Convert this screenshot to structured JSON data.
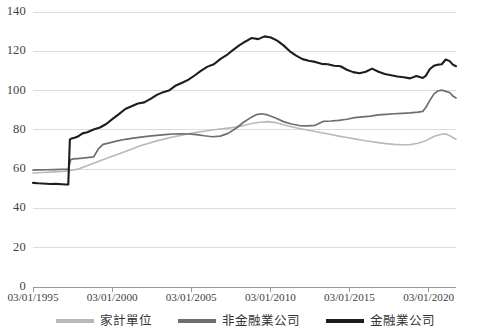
{
  "chart_data": {
    "type": "line",
    "title": "",
    "subtitle": "",
    "xlabel": "",
    "ylabel": "",
    "ylim": [
      0,
      140
    ],
    "yticks": [
      0,
      20,
      40,
      60,
      80,
      100,
      120,
      140
    ],
    "xticks": [
      "03/01/1995",
      "03/01/2000",
      "03/01/2005",
      "03/01/2010",
      "03/01/2015",
      "03/01/2020"
    ],
    "xtick_years": [
      1995,
      2000,
      2005,
      2010,
      2015,
      2020
    ],
    "xlim_years": [
      1995.17,
      2021.9
    ],
    "grid": "horizontal",
    "legend_position": "bottom",
    "series": [
      {
        "name": "家計單位",
        "color": "#b9b9b9",
        "linewidth": 1.6,
        "x": [
          1995.17,
          1995.5,
          1996.0,
          1996.5,
          1997.0,
          1997.25,
          1997.5,
          1997.75,
          1998.0,
          1998.5,
          1999.0,
          1999.5,
          2000.0,
          2000.5,
          2001.0,
          2001.5,
          2002.0,
          2002.5,
          2003.0,
          2003.5,
          2004.0,
          2004.5,
          2005.0,
          2005.5,
          2006.0,
          2006.5,
          2007.0,
          2007.5,
          2008.0,
          2008.5,
          2009.0,
          2009.5,
          2010.0,
          2010.5,
          2011.0,
          2011.5,
          2012.0,
          2012.5,
          2013.0,
          2013.5,
          2014.0,
          2014.5,
          2015.0,
          2015.5,
          2016.0,
          2016.5,
          2017.0,
          2017.5,
          2018.0,
          2018.5,
          2019.0,
          2019.5,
          2020.0,
          2020.25,
          2020.5,
          2020.75,
          2021.0,
          2021.25,
          2021.5,
          2021.9
        ],
        "values": [
          58.0,
          58.2,
          58.4,
          58.6,
          58.8,
          59.0,
          59.3,
          59.6,
          60.0,
          61.5,
          63.0,
          64.5,
          66.0,
          67.5,
          69.0,
          70.5,
          72.0,
          73.2,
          74.4,
          75.4,
          76.4,
          77.2,
          78.0,
          78.7,
          79.3,
          79.9,
          80.4,
          80.9,
          81.4,
          82.2,
          83.2,
          83.9,
          84.2,
          83.7,
          82.6,
          81.6,
          80.7,
          79.9,
          79.2,
          78.4,
          77.6,
          76.8,
          76.1,
          75.4,
          74.7,
          74.1,
          73.5,
          73.0,
          72.6,
          72.4,
          72.5,
          73.2,
          74.5,
          75.6,
          76.6,
          77.3,
          77.8,
          78.0,
          77.0,
          75.2
        ]
      },
      {
        "name": "非金融業公司",
        "color": "#6e6e6e",
        "linewidth": 1.7,
        "x": [
          1995.17,
          1995.5,
          1996.0,
          1996.5,
          1997.0,
          1997.4,
          1997.55,
          1997.7,
          1998.0,
          1998.3,
          1998.6,
          1999.0,
          1999.3,
          1999.6,
          2000.0,
          2000.5,
          2001.0,
          2001.5,
          2002.0,
          2002.5,
          2003.0,
          2003.5,
          2004.0,
          2004.5,
          2005.0,
          2005.5,
          2006.0,
          2006.5,
          2007.0,
          2007.5,
          2008.0,
          2008.5,
          2009.0,
          2009.3,
          2009.6,
          2010.0,
          2010.5,
          2011.0,
          2011.5,
          2012.0,
          2012.5,
          2013.0,
          2013.5,
          2014.0,
          2014.5,
          2015.0,
          2015.5,
          2016.0,
          2016.5,
          2017.0,
          2017.5,
          2018.0,
          2018.5,
          2019.0,
          2019.5,
          2019.8,
          2020.0,
          2020.25,
          2020.5,
          2020.75,
          2021.0,
          2021.25,
          2021.5,
          2021.7,
          2021.9
        ],
        "values": [
          59.5,
          59.6,
          59.7,
          59.8,
          59.9,
          60.0,
          64.8,
          65.2,
          65.4,
          65.6,
          65.9,
          66.2,
          70.3,
          72.6,
          73.4,
          74.4,
          75.2,
          75.8,
          76.3,
          76.8,
          77.2,
          77.6,
          77.9,
          78.0,
          77.9,
          77.6,
          77.0,
          76.5,
          76.8,
          78.2,
          80.8,
          84.0,
          86.6,
          87.8,
          88.2,
          87.6,
          86.0,
          84.2,
          83.0,
          82.2,
          82.0,
          82.3,
          84.3,
          84.5,
          84.8,
          85.4,
          86.2,
          86.6,
          87.0,
          87.6,
          87.9,
          88.2,
          88.4,
          88.6,
          89.0,
          89.4,
          91.5,
          95.0,
          98.2,
          99.8,
          100.2,
          99.6,
          99.0,
          97.2,
          96.2
        ]
      },
      {
        "name": "金融業公司",
        "color": "#1d1d1d",
        "linewidth": 2.1,
        "x": [
          1995.17,
          1995.5,
          1996.0,
          1996.3,
          1996.6,
          1997.0,
          1997.25,
          1997.4,
          1997.5,
          1997.6,
          1997.8,
          1998.0,
          1998.3,
          1998.6,
          1999.0,
          1999.4,
          1999.8,
          2000.2,
          2000.6,
          2001.0,
          2001.4,
          2001.8,
          2002.2,
          2002.6,
          2003.0,
          2003.4,
          2003.8,
          2004.2,
          2004.6,
          2005.0,
          2005.4,
          2005.8,
          2006.2,
          2006.6,
          2007.0,
          2007.4,
          2007.8,
          2008.2,
          2008.6,
          2009.0,
          2009.4,
          2009.8,
          2010.2,
          2010.6,
          2011.0,
          2011.4,
          2011.8,
          2012.2,
          2012.6,
          2013.0,
          2013.4,
          2013.8,
          2014.2,
          2014.6,
          2015.0,
          2015.4,
          2015.8,
          2016.2,
          2016.6,
          2017.0,
          2017.4,
          2017.8,
          2018.2,
          2018.6,
          2019.0,
          2019.4,
          2019.8,
          2020.0,
          2020.25,
          2020.5,
          2020.75,
          2021.0,
          2021.25,
          2021.5,
          2021.7,
          2021.9
        ],
        "values": [
          53.0,
          52.8,
          52.6,
          52.4,
          52.5,
          52.3,
          52.2,
          52.2,
          75.0,
          75.6,
          76.0,
          76.6,
          78.2,
          78.8,
          80.2,
          81.2,
          83.0,
          85.6,
          88.0,
          90.6,
          92.0,
          93.4,
          94.0,
          95.8,
          97.8,
          99.2,
          100.2,
          102.6,
          104.0,
          105.6,
          107.8,
          110.2,
          112.2,
          113.4,
          116.0,
          118.0,
          120.6,
          123.0,
          125.0,
          126.8,
          126.2,
          127.6,
          127.0,
          125.4,
          123.0,
          120.0,
          117.8,
          116.0,
          115.2,
          114.6,
          113.6,
          113.4,
          112.6,
          112.4,
          110.6,
          109.4,
          108.8,
          109.6,
          111.2,
          109.6,
          108.4,
          107.8,
          107.2,
          106.8,
          106.2,
          107.4,
          106.4,
          107.6,
          111.0,
          112.6,
          113.2,
          113.4,
          115.8,
          115.0,
          113.2,
          112.4
        ]
      }
    ]
  },
  "axes": {
    "y_tick_labels": [
      "140",
      "120",
      "100",
      "80",
      "60",
      "40",
      "20",
      "0"
    ],
    "x_tick_labels": [
      "03/01/1995",
      "03/01/2000",
      "03/01/2005",
      "03/01/2010",
      "03/01/2015",
      "03/01/2020"
    ]
  },
  "legend": {
    "items": [
      {
        "label": "家計單位",
        "color": "#b9b9b9"
      },
      {
        "label": "非金融業公司",
        "color": "#6e6e6e"
      },
      {
        "label": "金融業公司",
        "color": "#1d1d1d"
      }
    ]
  },
  "colors": {
    "grid": "#dcdcdc",
    "axis": "#9a9a9a",
    "text": "#3f3f3f",
    "background": "#ffffff"
  }
}
